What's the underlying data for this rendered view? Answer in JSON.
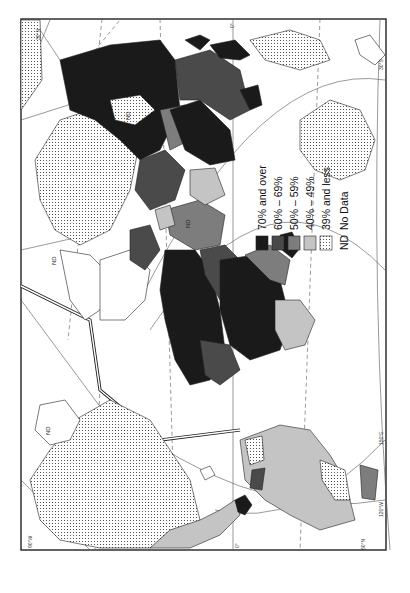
{
  "map": {
    "orientation": "rotated 90° clockwise (north to the left)",
    "colors": {
      "c70": "#1a1a1a",
      "c60": "#4a4a4a",
      "c50": "#7d7d7d",
      "c40": "#c4c4c4",
      "c39": "dots",
      "nd": "#ffffff"
    },
    "legend": {
      "items": [
        {
          "swatch": "c70",
          "label": "70% and over"
        },
        {
          "swatch": "c60",
          "label": "60% – 69%"
        },
        {
          "swatch": "c50",
          "label": "50% – 59%"
        },
        {
          "swatch": "c40",
          "label": "40% – 49%"
        },
        {
          "swatch": "c39",
          "label": "39% and less"
        },
        {
          "swatch": "nd_text",
          "code": "ND",
          "label": "No Data"
        }
      ]
    },
    "grid_labels": {
      "top_0": "0°",
      "top_left_30n": "30°N",
      "bottom_120e": "120°E",
      "bottom_0": "0°",
      "right_150e": "150°E",
      "right_120w": "120°W",
      "right_60n": "60°N",
      "right_top_30s": "30°S",
      "left_90w": "90°W"
    },
    "nd_markers": [
      "ND",
      "ND",
      "ND",
      "ND",
      "ND"
    ]
  }
}
